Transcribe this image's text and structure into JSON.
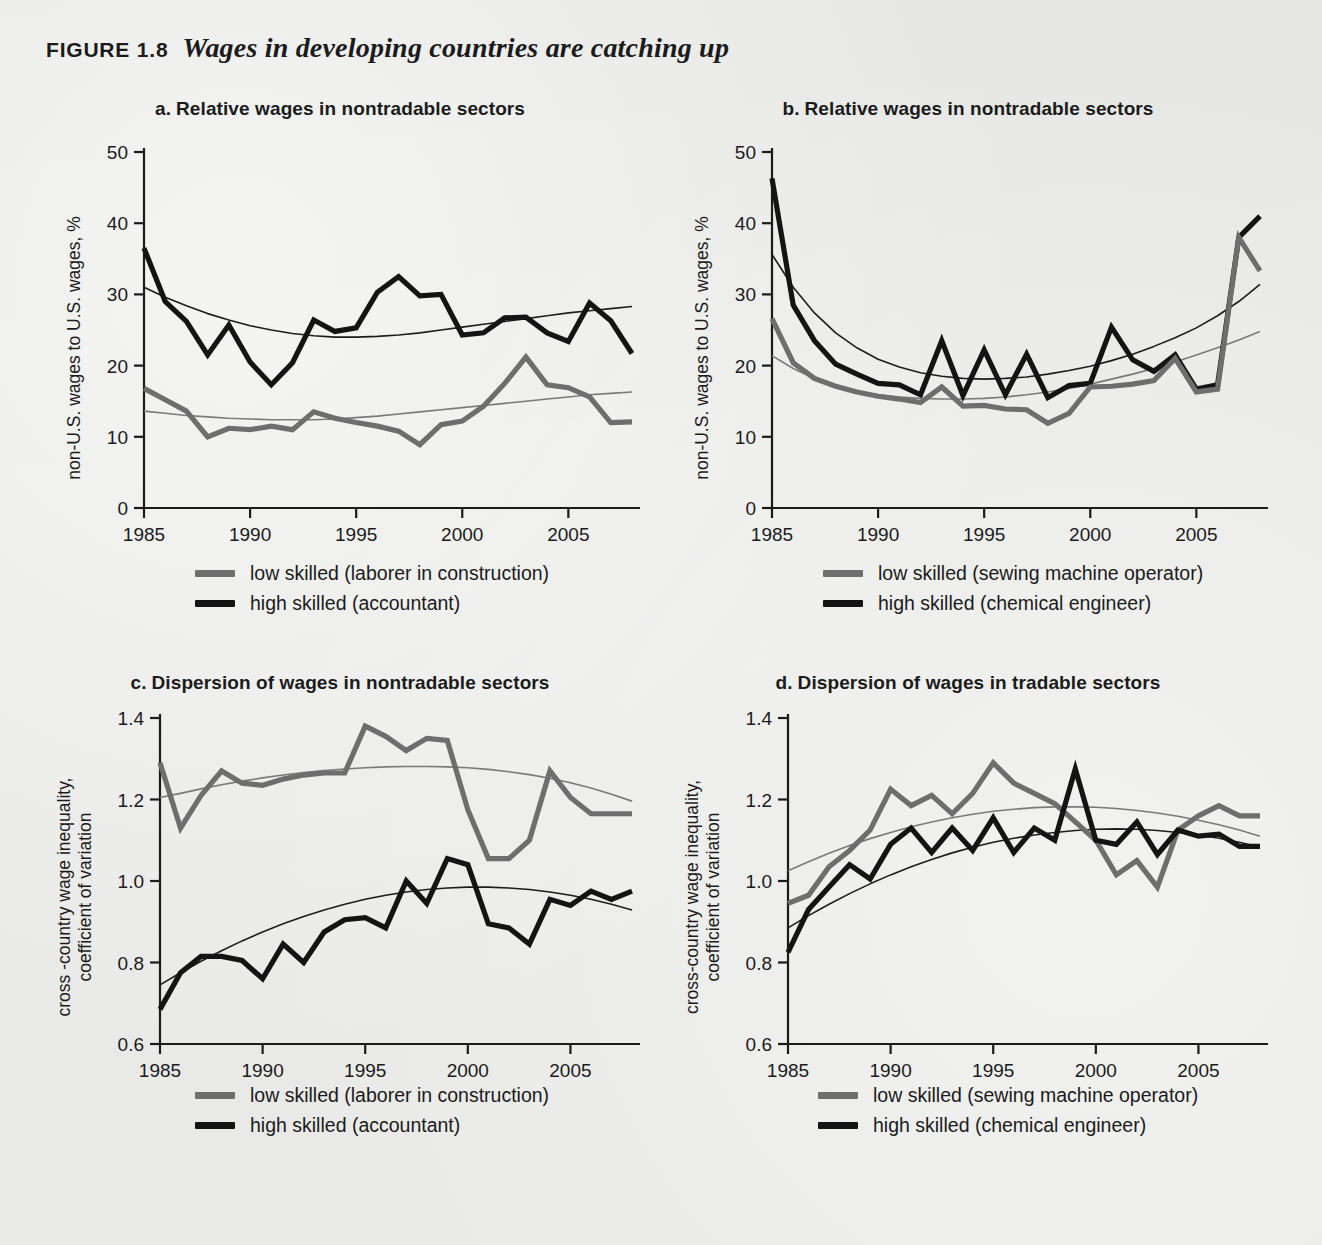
{
  "figure": {
    "number": "FIGURE 1.8",
    "title": "Wages in developing countries are catching up"
  },
  "colors": {
    "high_skilled": "#141414",
    "low_skilled": "#6e6e6e",
    "trend_high": "#1d1d1d",
    "trend_low": "#7a7a7a",
    "axis": "#1b1b1b",
    "background": "#e9e9e7"
  },
  "panels": {
    "a": {
      "letter": "a.",
      "title": "Relative wages in nontradable sectors",
      "ylabel": "non-U.S. wages to U.S. wages, %",
      "legend": [
        {
          "label": "low skilled (laborer in construction)",
          "series": "low_skilled"
        },
        {
          "label": "high skilled (accountant)",
          "series": "high_skilled"
        }
      ]
    },
    "b": {
      "letter": "b.",
      "title": "Relative wages in nontradable sectors",
      "ylabel": "non-U.S. wages to U.S. wages, %",
      "legend": [
        {
          "label": "low skilled (sewing machine operator)",
          "series": "low_skilled"
        },
        {
          "label": "high skilled (chemical engineer)",
          "series": "high_skilled"
        }
      ]
    },
    "c": {
      "letter": "c.",
      "title": "Dispersion of wages in nontradable sectors",
      "ylabel_line1": "cross -country wage inequality,",
      "ylabel_line2": "coefficient of variation",
      "legend": [
        {
          "label": "low skilled (laborer in construction)",
          "series": "low_skilled"
        },
        {
          "label": "high skilled (accountant)",
          "series": "high_skilled"
        }
      ]
    },
    "d": {
      "letter": "d.",
      "title": "Dispersion of wages in tradable sectors",
      "ylabel_line1": "cross-country wage inequality,",
      "ylabel_line2": "coefficient of variation",
      "legend": [
        {
          "label": "low skilled (sewing machine operator)",
          "series": "low_skilled"
        },
        {
          "label": "high skilled (chemical engineer)",
          "series": "high_skilled"
        }
      ]
    }
  },
  "chart_data": [
    {
      "id": "a",
      "type": "line",
      "title": "a. Relative wages in nontradable sectors",
      "xlabel": "",
      "ylabel": "non-U.S. wages to U.S. wages, %",
      "xlim": [
        1985,
        2008
      ],
      "ylim": [
        0,
        50
      ],
      "xticks": [
        1985,
        1990,
        1995,
        2000,
        2005
      ],
      "yticks": [
        0,
        10,
        20,
        30,
        40,
        50
      ],
      "grid": false,
      "legend_position": "below",
      "x": [
        1985,
        1986,
        1987,
        1988,
        1989,
        1990,
        1991,
        1992,
        1993,
        1994,
        1995,
        1996,
        1997,
        1998,
        1999,
        2000,
        2001,
        2002,
        2003,
        2004,
        2005,
        2006,
        2007,
        2008
      ],
      "series": [
        {
          "name": "high skilled (accountant)",
          "color": "#141414",
          "values": [
            36.5,
            29.0,
            26.2,
            21.5,
            25.7,
            20.5,
            17.3,
            20.4,
            26.4,
            24.8,
            25.3,
            30.3,
            32.5,
            29.8,
            30.0,
            24.3,
            24.6,
            26.7,
            26.8,
            24.6,
            23.4,
            28.8,
            26.3,
            21.7
          ]
        },
        {
          "name": "low skilled (laborer in construction)",
          "color": "#6e6e6e",
          "values": [
            16.8,
            15.2,
            13.6,
            10.0,
            11.2,
            11.0,
            11.5,
            11.0,
            13.5,
            12.6,
            12.0,
            11.5,
            10.8,
            8.9,
            11.7,
            12.2,
            14.3,
            17.5,
            21.2,
            17.3,
            16.9,
            15.6,
            12.0,
            12.1
          ]
        },
        {
          "name": "trend high skilled",
          "color": "#1d1d1d",
          "trend": true,
          "values": [
            31.0,
            29.6,
            28.4,
            27.3,
            26.4,
            25.6,
            25.0,
            24.5,
            24.2,
            24.0,
            24.0,
            24.1,
            24.3,
            24.6,
            25.0,
            25.4,
            25.8,
            26.2,
            26.6,
            27.0,
            27.4,
            27.7,
            28.0,
            28.3
          ]
        },
        {
          "name": "trend low skilled",
          "color": "#7a7a7a",
          "trend": true,
          "values": [
            13.6,
            13.3,
            13.0,
            12.8,
            12.6,
            12.5,
            12.4,
            12.4,
            12.4,
            12.5,
            12.7,
            12.9,
            13.2,
            13.5,
            13.8,
            14.1,
            14.4,
            14.7,
            15.0,
            15.3,
            15.6,
            15.9,
            16.1,
            16.3
          ]
        }
      ]
    },
    {
      "id": "b",
      "type": "line",
      "title": "b. Relative wages in nontradable sectors",
      "xlabel": "",
      "ylabel": "non-U.S. wages to U.S. wages, %",
      "xlim": [
        1985,
        2008
      ],
      "ylim": [
        0,
        50
      ],
      "xticks": [
        1985,
        1990,
        1995,
        2000,
        2005
      ],
      "yticks": [
        0,
        10,
        20,
        30,
        40,
        50
      ],
      "grid": false,
      "legend_position": "below",
      "x": [
        1985,
        1986,
        1987,
        1988,
        1989,
        1990,
        1991,
        1992,
        1993,
        1994,
        1995,
        1996,
        1997,
        1998,
        1999,
        2000,
        2001,
        2002,
        2003,
        2004,
        2005,
        2006,
        2007,
        2008
      ],
      "series": [
        {
          "name": "high skilled (chemical engineer)",
          "color": "#141414",
          "values": [
            46.3,
            28.5,
            23.5,
            20.2,
            18.8,
            17.5,
            17.3,
            15.9,
            23.5,
            15.8,
            22.2,
            15.9,
            21.6,
            15.5,
            17.2,
            17.5,
            25.4,
            20.8,
            19.2,
            21.5,
            16.7,
            17.3,
            38.0,
            41.0
          ]
        },
        {
          "name": "low skilled (sewing machine operator)",
          "color": "#6e6e6e",
          "values": [
            26.6,
            20.4,
            18.2,
            17.1,
            16.3,
            15.7,
            15.3,
            14.8,
            17.0,
            14.3,
            14.4,
            13.9,
            13.8,
            11.9,
            13.3,
            17.0,
            17.1,
            17.4,
            17.9,
            21.0,
            16.3,
            16.7,
            38.0,
            33.3
          ]
        },
        {
          "name": "trend high skilled",
          "color": "#1d1d1d",
          "trend": true,
          "values": [
            35.6,
            31.0,
            27.4,
            24.6,
            22.5,
            20.9,
            19.8,
            19.0,
            18.5,
            18.2,
            18.1,
            18.2,
            18.4,
            18.8,
            19.3,
            19.9,
            20.7,
            21.6,
            22.7,
            23.9,
            25.3,
            27.0,
            29.0,
            31.4
          ]
        },
        {
          "name": "trend low skilled",
          "color": "#7a7a7a",
          "trend": true,
          "values": [
            21.4,
            19.6,
            18.2,
            17.1,
            16.4,
            15.9,
            15.6,
            15.4,
            15.3,
            15.3,
            15.4,
            15.6,
            15.9,
            16.3,
            16.8,
            17.4,
            18.1,
            18.8,
            19.6,
            20.5,
            21.5,
            22.5,
            23.6,
            24.8
          ]
        }
      ]
    },
    {
      "id": "c",
      "type": "line",
      "title": "c. Dispersion of wages in nontradable sectors",
      "xlabel": "",
      "ylabel": "cross -country wage inequality, coefficient of variation",
      "xlim": [
        1985,
        2008
      ],
      "ylim": [
        0.6,
        1.4
      ],
      "xticks": [
        1985,
        1990,
        1995,
        2000,
        2005
      ],
      "yticks": [
        0.6,
        0.8,
        1.0,
        1.2,
        1.4
      ],
      "grid": false,
      "legend_position": "below",
      "x": [
        1985,
        1986,
        1987,
        1988,
        1989,
        1990,
        1991,
        1992,
        1993,
        1994,
        1995,
        1996,
        1997,
        1998,
        1999,
        2000,
        2001,
        2002,
        2003,
        2004,
        2005,
        2006,
        2007,
        2008
      ],
      "series": [
        {
          "name": "low skilled (laborer in construction)",
          "color": "#6e6e6e",
          "values": [
            1.29,
            1.13,
            1.21,
            1.27,
            1.24,
            1.235,
            1.25,
            1.26,
            1.265,
            1.265,
            1.38,
            1.355,
            1.32,
            1.35,
            1.345,
            1.175,
            1.055,
            1.055,
            1.1,
            1.27,
            1.205,
            1.165,
            1.165,
            1.165
          ]
        },
        {
          "name": "high skilled (accountant)",
          "color": "#141414",
          "values": [
            0.685,
            0.775,
            0.815,
            0.815,
            0.805,
            0.76,
            0.845,
            0.8,
            0.875,
            0.905,
            0.91,
            0.885,
            1.0,
            0.945,
            1.055,
            1.04,
            0.895,
            0.885,
            0.845,
            0.955,
            0.94,
            0.975,
            0.955,
            0.975
          ]
        },
        {
          "name": "trend low skilled",
          "color": "#7a7a7a",
          "trend": true,
          "values": [
            1.205,
            1.215,
            1.226,
            1.236,
            1.245,
            1.253,
            1.26,
            1.266,
            1.271,
            1.275,
            1.278,
            1.28,
            1.281,
            1.281,
            1.28,
            1.278,
            1.274,
            1.268,
            1.261,
            1.252,
            1.241,
            1.228,
            1.213,
            1.196
          ]
        },
        {
          "name": "trend high skilled",
          "color": "#1d1d1d",
          "trend": true,
          "values": [
            0.745,
            0.775,
            0.803,
            0.829,
            0.853,
            0.875,
            0.895,
            0.913,
            0.929,
            0.943,
            0.955,
            0.965,
            0.973,
            0.979,
            0.983,
            0.985,
            0.985,
            0.983,
            0.979,
            0.973,
            0.965,
            0.955,
            0.943,
            0.929
          ]
        }
      ]
    },
    {
      "id": "d",
      "type": "line",
      "title": "d. Dispersion of wages in tradable sectors",
      "xlabel": "",
      "ylabel": "cross-country wage inequality, coefficient of variation",
      "xlim": [
        1985,
        2008
      ],
      "ylim": [
        0.6,
        1.4
      ],
      "xticks": [
        1985,
        1990,
        1995,
        2000,
        2005
      ],
      "yticks": [
        0.6,
        0.8,
        1.0,
        1.2,
        1.4
      ],
      "grid": false,
      "legend_position": "below",
      "x": [
        1985,
        1986,
        1987,
        1988,
        1989,
        1990,
        1991,
        1992,
        1993,
        1994,
        1995,
        1996,
        1997,
        1998,
        1999,
        2000,
        2001,
        2002,
        2003,
        2004,
        2005,
        2006,
        2007,
        2008
      ],
      "series": [
        {
          "name": "low skilled (sewing machine operator)",
          "color": "#6e6e6e",
          "values": [
            0.945,
            0.965,
            1.035,
            1.075,
            1.125,
            1.225,
            1.185,
            1.21,
            1.165,
            1.215,
            1.29,
            1.24,
            1.215,
            1.19,
            1.145,
            1.1,
            1.015,
            1.05,
            0.985,
            1.125,
            1.16,
            1.185,
            1.16,
            1.16
          ]
        },
        {
          "name": "high skilled (chemical engineer)",
          "color": "#141414",
          "values": [
            0.825,
            0.93,
            0.985,
            1.04,
            1.005,
            1.09,
            1.13,
            1.07,
            1.13,
            1.075,
            1.155,
            1.07,
            1.13,
            1.1,
            1.275,
            1.1,
            1.09,
            1.145,
            1.065,
            1.125,
            1.11,
            1.115,
            1.085,
            1.085
          ]
        },
        {
          "name": "trend low skilled",
          "color": "#7a7a7a",
          "trend": true,
          "values": [
            1.025,
            1.047,
            1.068,
            1.087,
            1.104,
            1.119,
            1.133,
            1.145,
            1.155,
            1.164,
            1.171,
            1.176,
            1.18,
            1.182,
            1.182,
            1.181,
            1.178,
            1.173,
            1.167,
            1.159,
            1.149,
            1.138,
            1.125,
            1.11
          ]
        },
        {
          "name": "trend high skilled",
          "color": "#1d1d1d",
          "trend": true,
          "values": [
            0.885,
            0.915,
            0.943,
            0.969,
            0.993,
            1.015,
            1.035,
            1.053,
            1.069,
            1.083,
            1.095,
            1.105,
            1.113,
            1.119,
            1.124,
            1.127,
            1.128,
            1.127,
            1.124,
            1.119,
            1.113,
            1.105,
            1.095,
            1.083
          ]
        }
      ]
    }
  ]
}
